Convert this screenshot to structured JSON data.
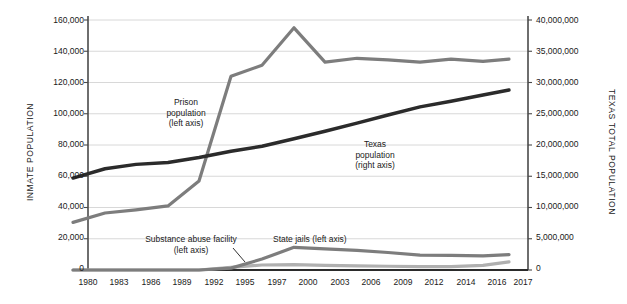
{
  "chart_data": {
    "type": "line",
    "title": "",
    "subtitle": "",
    "xlabel": "",
    "ylabel": "INMATE POPULATION",
    "y2label": "TEXAS TOTAL POPULATION",
    "grid": true,
    "legend_position": "inline-annotations",
    "x": [
      1980,
      1983,
      1986,
      1989,
      1992,
      1995,
      1997,
      2000,
      2003,
      2006,
      2009,
      2012,
      2014,
      2016,
      2017
    ],
    "xtick_labels": [
      "1980",
      "1983",
      "1986",
      "1989",
      "1992",
      "1995",
      "1997",
      "2000",
      "2003",
      "2006",
      "2009",
      "2012",
      "2014",
      "2016",
      "2017"
    ],
    "ylim": [
      0,
      160000
    ],
    "ytick_labels": [
      "0",
      "20,000",
      "40,000",
      "60,000",
      "80,000",
      "100,000",
      "120,000",
      "140,000",
      "160,000"
    ],
    "ytick_values": [
      0,
      20000,
      40000,
      60000,
      80000,
      100000,
      120000,
      140000,
      160000
    ],
    "y2lim": [
      0,
      40000000
    ],
    "y2tick_labels": [
      "0",
      "5,000,000",
      "10,000,000",
      "15,000,000",
      "20,000,000",
      "25,000,000",
      "30,000,000",
      "35,000,000",
      "40,000,000"
    ],
    "y2tick_values": [
      0,
      5000000,
      10000000,
      15000000,
      20000000,
      25000000,
      30000000,
      35000000,
      40000000
    ],
    "series": [
      {
        "name": "Prison population",
        "axis": "left",
        "color": "#7d7d7d",
        "values": [
          30500,
          36500,
          38500,
          41000,
          57000,
          124000,
          131000,
          155000,
          133000,
          135500,
          134500,
          133000,
          135000,
          133500,
          135000
        ]
      },
      {
        "name": "Texas population",
        "axis": "right",
        "color": "#2b2b2b",
        "values": [
          14700000,
          16200000,
          16900000,
          17200000,
          18000000,
          19000000,
          19800000,
          21000000,
          22200000,
          23500000,
          24800000,
          26100000,
          27000000,
          28000000,
          28800000
        ]
      },
      {
        "name": "State jails",
        "axis": "left",
        "color": "#7d7d7d",
        "values": [
          0,
          0,
          0,
          0,
          0,
          1200,
          7000,
          14500,
          13500,
          12500,
          11200,
          9500,
          9300,
          9000,
          9800
        ]
      },
      {
        "name": "Substance abuse facility",
        "axis": "left",
        "color": "#b0b0b0",
        "values": [
          0,
          0,
          0,
          0,
          0,
          1700,
          3200,
          3400,
          3000,
          2600,
          2400,
          2200,
          2100,
          3000,
          5200
        ]
      }
    ],
    "annotations": [
      {
        "id": "prison",
        "lines": [
          "Prison",
          "population",
          "(left axis)"
        ]
      },
      {
        "id": "texas",
        "lines": [
          "Texas",
          "population",
          "(right axis)"
        ]
      },
      {
        "id": "substance",
        "lines": [
          "Substance abuse facility",
          "(left axis)"
        ]
      },
      {
        "id": "statejails",
        "lines": [
          "State jails (left axis)"
        ]
      }
    ]
  },
  "axes": {
    "left_title": "INMATE POPULATION",
    "right_title": "TEXAS TOTAL POPULATION"
  },
  "ylabels_left": {
    "t0": "0",
    "t1": "20,000",
    "t2": "40,000",
    "t3": "60,000",
    "t4": "80,000",
    "t5": "100,000",
    "t6": "120,000",
    "t7": "140,000",
    "t8": "160,000"
  },
  "ylabels_right": {
    "t0": "0",
    "t1": "5,000,000",
    "t2": "10,000,000",
    "t3": "15,000,000",
    "t4": "20,000,000",
    "t5": "25,000,000",
    "t6": "30,000,000",
    "t7": "35,000,000",
    "t8": "40,000,000"
  },
  "xlabels": {
    "x0": "1980",
    "x1": "1983",
    "x2": "1986",
    "x3": "1989",
    "x4": "1992",
    "x5": "1995",
    "x6": "1997",
    "x7": "2000",
    "x8": "2003",
    "x9": "2006",
    "x10": "2009",
    "x11": "2012",
    "x12": "2014",
    "x13": "2016",
    "x14": "2017"
  },
  "annotations": {
    "prison_l1": "Prison",
    "prison_l2": "population",
    "prison_l3": "(left axis)",
    "texas_l1": "Texas",
    "texas_l2": "population",
    "texas_l3": "(right axis)",
    "substance_l1": "Substance abuse facility",
    "substance_l2": "(left axis)",
    "statejails_l1": "State jails (left axis)"
  },
  "colors": {
    "prison_line": "#7d7d7d",
    "texas_line": "#2b2b2b",
    "statejails_line": "#7d7d7d",
    "substance_line": "#b0b0b0",
    "grid": "#d4d4d4",
    "axis": "#4a4a4a",
    "text": "#1a1a1a",
    "background": "#ffffff"
  }
}
